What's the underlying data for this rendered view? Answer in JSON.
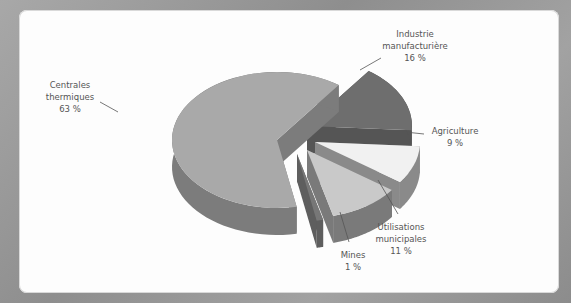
{
  "chart_data": {
    "type": "pie",
    "style": "3d-exploded",
    "title": "",
    "slices": [
      {
        "label_lines": [
          "Centrales",
          "thermiques"
        ],
        "value": 63,
        "value_label": "63 %",
        "top_color": "#a9a9a9",
        "side_color": "#7c7c7c"
      },
      {
        "label_lines": [
          "Industrie",
          "manufacturière"
        ],
        "value": 16,
        "value_label": "16 %",
        "top_color": "#6e6e6e",
        "side_color": "#555555"
      },
      {
        "label_lines": [
          "Agriculture"
        ],
        "value": 9,
        "value_label": "9 %",
        "top_color": "#f1f1f1",
        "side_color": "#8a8a8a"
      },
      {
        "label_lines": [
          "Mines"
        ],
        "value": 1,
        "value_label": "1 %",
        "top_color": "#777777",
        "side_color": "#5e5e5e"
      },
      {
        "label_lines": [
          "Utilisations",
          "municipales"
        ],
        "value": 11,
        "value_label": "11 %",
        "top_color": "#c9c9c9",
        "side_color": "#7a7a7a"
      }
    ],
    "legend": "none"
  }
}
